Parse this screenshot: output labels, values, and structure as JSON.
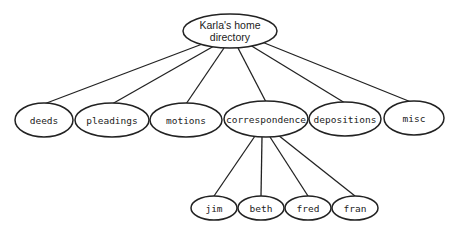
{
  "diagram": {
    "root": {
      "label_line1": "Karla's home",
      "label_line2": "directory",
      "cx": 230,
      "cy": 31,
      "rx": 47,
      "ry": 17
    },
    "folders": [
      {
        "label": "deeds",
        "cx": 44,
        "cy": 120,
        "rx": 29,
        "ry": 17
      },
      {
        "label": "pleadings",
        "cx": 112,
        "cy": 120,
        "rx": 37,
        "ry": 17
      },
      {
        "label": "motions",
        "cx": 186,
        "cy": 120,
        "rx": 36,
        "ry": 17
      },
      {
        "label": "correspondence",
        "cx": 266,
        "cy": 119,
        "rx": 42,
        "ry": 18
      },
      {
        "label": "depositions",
        "cx": 345,
        "cy": 119,
        "rx": 36,
        "ry": 17
      },
      {
        "label": "misc",
        "cx": 414,
        "cy": 118,
        "rx": 30,
        "ry": 17
      }
    ],
    "subfolders_parent": "correspondence",
    "subfolders": [
      {
        "label": "jim",
        "cx": 214,
        "cy": 208,
        "rx": 23,
        "ry": 12
      },
      {
        "label": "beth",
        "cx": 261,
        "cy": 208,
        "rx": 23,
        "ry": 12
      },
      {
        "label": "fred",
        "cx": 308,
        "cy": 208,
        "rx": 23,
        "ry": 12
      },
      {
        "label": "fran",
        "cx": 355,
        "cy": 208,
        "rx": 23,
        "ry": 12
      }
    ],
    "colors": {
      "stroke": "#222222",
      "fill": "#ffffff",
      "text": "#222222"
    }
  }
}
